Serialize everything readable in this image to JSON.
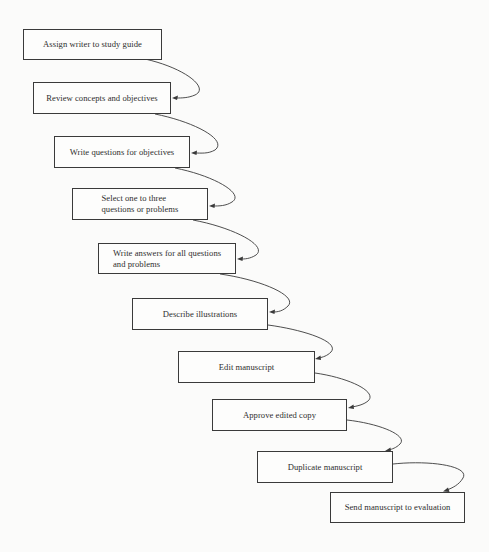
{
  "diagram": {
    "type": "flowchart",
    "direction": "top-left to bottom-right staircase",
    "colors": {
      "background": "#fbfbfa",
      "box_border": "#3a3a3a",
      "text": "#2e2e2e",
      "connector": "#3a3a3a"
    },
    "steps": [
      {
        "id": 1,
        "label": "Assign writer to study guide"
      },
      {
        "id": 2,
        "label": "Review concepts and objectives"
      },
      {
        "id": 3,
        "label": "Write questions for objectives"
      },
      {
        "id": 4,
        "label": "Select one to three\nquestions or problems"
      },
      {
        "id": 5,
        "label": "Write answers for all questions\nand problems"
      },
      {
        "id": 6,
        "label": "Describe illustrations"
      },
      {
        "id": 7,
        "label": "Edit manuscript"
      },
      {
        "id": 8,
        "label": "Approve edited copy"
      },
      {
        "id": 9,
        "label": "Duplicate manuscript"
      },
      {
        "id": 10,
        "label": "Send manuscript to evaluation"
      }
    ],
    "connectors": [
      {
        "from": 1,
        "to": 2
      },
      {
        "from": 2,
        "to": 3
      },
      {
        "from": 3,
        "to": 4
      },
      {
        "from": 4,
        "to": 5
      },
      {
        "from": 5,
        "to": 6
      },
      {
        "from": 6,
        "to": 7
      },
      {
        "from": 7,
        "to": 8
      },
      {
        "from": 8,
        "to": 9
      },
      {
        "from": 9,
        "to": 10
      }
    ]
  }
}
